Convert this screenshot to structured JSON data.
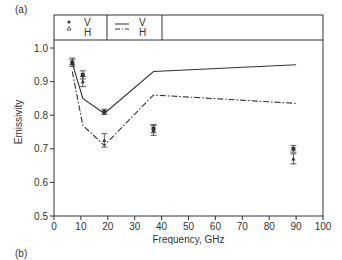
{
  "panel_labels": {
    "top": "(a)",
    "bottom": "(b)"
  },
  "chart_data": {
    "type": "line",
    "title": "",
    "xlabel": "Frequency, GHz",
    "ylabel": "Emissivity",
    "xlim": [
      0,
      100
    ],
    "ylim": [
      0.5,
      1.0
    ],
    "xticks": [
      0,
      10,
      20,
      30,
      40,
      50,
      60,
      70,
      80,
      90,
      100
    ],
    "yticks": [
      0.5,
      0.6,
      0.7,
      0.8,
      0.9,
      1.0
    ],
    "ytick_labels": [
      "0.5",
      "0.6",
      "0.7",
      "0.8",
      "0.9",
      "1.0"
    ],
    "grid": false,
    "legend_position": "top, inside boxed header",
    "legend": [
      {
        "name": "V",
        "marker": "filled-circle",
        "kind": "observed"
      },
      {
        "name": "H",
        "marker": "open-triangle",
        "kind": "observed"
      },
      {
        "name": "V",
        "line": "solid",
        "kind": "model"
      },
      {
        "name": "H",
        "line": "dash-dot",
        "kind": "model"
      }
    ],
    "series": [
      {
        "name": "V (model)",
        "style": "solid",
        "x": [
          6.8,
          10.7,
          18.7,
          37,
          90
        ],
        "y": [
          0.955,
          0.85,
          0.805,
          0.93,
          0.95
        ]
      },
      {
        "name": "H (model)",
        "style": "dash-dot",
        "x": [
          6.8,
          10.7,
          18.7,
          37,
          90
        ],
        "y": [
          0.93,
          0.77,
          0.71,
          0.86,
          0.835
        ]
      },
      {
        "name": "V (observed)",
        "style": "filled-circle",
        "x": [
          6.8,
          10.7,
          18.7,
          37,
          89
        ],
        "y": [
          0.955,
          0.92,
          0.81,
          0.76,
          0.7
        ],
        "err": [
          0.01,
          0.012,
          0.008,
          0.012,
          0.01
        ]
      },
      {
        "name": "H (observed)",
        "style": "open-triangle",
        "x": [
          6.8,
          10.7,
          18.7,
          37,
          89
        ],
        "y": [
          0.96,
          0.9,
          0.725,
          0.755,
          0.67
        ],
        "err": [
          0.01,
          0.015,
          0.02,
          0.015,
          0.015
        ]
      }
    ]
  }
}
